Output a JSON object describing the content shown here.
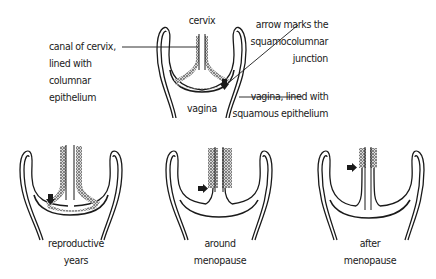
{
  "diagram": {
    "type": "anatomical illustration",
    "main_figure": {
      "labels": {
        "cervix": "cervix",
        "vagina": "vagina",
        "canal": [
          "canal of cervix,",
          "lined with",
          "columnar",
          "epithelium"
        ],
        "arrow": [
          "arrow marks the",
          "squamocolumnar",
          "junction"
        ],
        "vagina_lining": [
          "vagina, lined with",
          "squamous epithelium"
        ]
      }
    },
    "stages": [
      {
        "id": "reproductive",
        "caption": [
          "reproductive",
          "years"
        ]
      },
      {
        "id": "around-menopause",
        "caption": [
          "around",
          "menopause"
        ]
      },
      {
        "id": "after-menopause",
        "caption": [
          "after",
          "menopause"
        ]
      }
    ],
    "colors": {
      "ink": "#1a1a1a",
      "background": "#ffffff"
    }
  }
}
